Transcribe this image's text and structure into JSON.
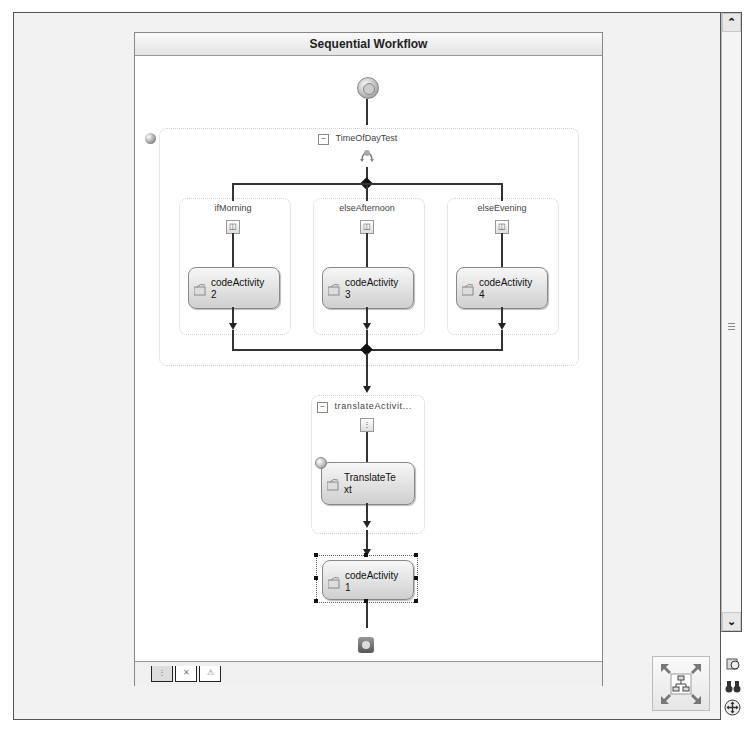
{
  "workflow": {
    "title": "Sequential Workflow",
    "start_icon": "workflow-start-icon",
    "end_icon": "workflow-end-icon"
  },
  "ifelse": {
    "name": "TimeOfDayTest",
    "collapse_glyph": "⊟",
    "branches": [
      {
        "name": "ifMorning",
        "activity": {
          "line1": "codeActivity",
          "line2": "2"
        }
      },
      {
        "name": "elseAfternoon",
        "activity": {
          "line1": "codeActivity",
          "line2": "3"
        }
      },
      {
        "name": "elseEvening",
        "activity": {
          "line1": "codeActivity",
          "line2": "4"
        }
      }
    ]
  },
  "translate": {
    "name": "translateActivit...",
    "collapse_glyph": "⊟",
    "activity": {
      "line1": "TranslateTe",
      "line2": "xt"
    }
  },
  "final_activity": {
    "line1": "codeActivity",
    "line2": "1",
    "selected": true
  },
  "bottom_tabs": [
    {
      "name": "workflow-view-tab",
      "glyph": "⋮",
      "active": true
    },
    {
      "name": "cancel-handlers-tab",
      "glyph": "✕",
      "active": false
    },
    {
      "name": "fault-handlers-tab",
      "glyph": "⚠",
      "active": false
    }
  ],
  "scrollbar": {
    "up": "⌃",
    "down": "⌄"
  },
  "tools": {
    "pan_label": "fit-to-screen",
    "zoom_glyph": "🔍",
    "find_glyph": "👓",
    "pan_glyph": "⊕"
  },
  "colors": {
    "connector": "#333333",
    "activity_top": "#f7f7f7",
    "activity_bottom": "#cfcfcf",
    "canvas": "#ffffff",
    "frame": "#f2f2f2"
  }
}
